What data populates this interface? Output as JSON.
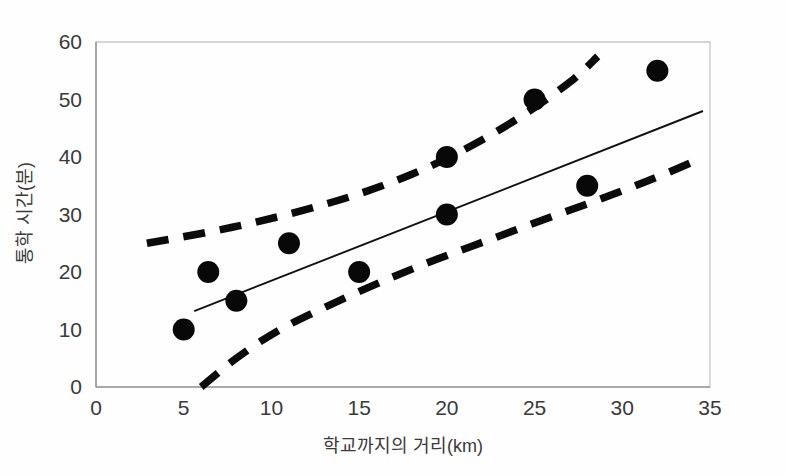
{
  "figure": {
    "background_color": "#ffffff",
    "point_color": "#080808",
    "line_color": "#111111",
    "band_color": "#0b0b0b",
    "axis_color": "#9a9a9a",
    "frame_color": "#c8c8c8",
    "text_color": "#3a3a3a"
  },
  "chart_data": {
    "type": "scatter",
    "title": "",
    "subtitle": "",
    "xlabel": "학교까지의 거리(km)",
    "ylabel": "통학 시간(분)",
    "xlim": [
      0,
      35
    ],
    "ylim": [
      0,
      60
    ],
    "xticks": [
      0,
      5,
      10,
      15,
      20,
      25,
      30,
      35
    ],
    "yticks": [
      0,
      10,
      20,
      30,
      40,
      50,
      60
    ],
    "xtick_labels": [
      "0",
      "5",
      "10",
      "15",
      "20",
      "25",
      "30",
      "35"
    ],
    "ytick_labels": [
      "0",
      "10",
      "20",
      "30",
      "40",
      "50",
      "60"
    ],
    "grid": false,
    "legend": null,
    "legend_position": "none",
    "series": [
      {
        "name": "observations",
        "type": "scatter",
        "marker": "filled-circle",
        "marker_size": 11,
        "color": "#080808",
        "points": [
          {
            "x": 5,
            "y": 10
          },
          {
            "x": 6.4,
            "y": 20
          },
          {
            "x": 8,
            "y": 15
          },
          {
            "x": 11,
            "y": 25
          },
          {
            "x": 15,
            "y": 20
          },
          {
            "x": 20,
            "y": 40
          },
          {
            "x": 20,
            "y": 30
          },
          {
            "x": 25,
            "y": 50
          },
          {
            "x": 28,
            "y": 35
          },
          {
            "x": 32,
            "y": 55
          }
        ]
      },
      {
        "name": "regression-line",
        "type": "line",
        "style": "solid",
        "color": "#111111",
        "points": [
          {
            "x": 5.6,
            "y": 13.2
          },
          {
            "x": 34.6,
            "y": 48.0
          }
        ]
      },
      {
        "name": "upper-confidence-band",
        "type": "line",
        "style": "dashed",
        "color": "#0b0b0b",
        "points": [
          {
            "x": 2.9,
            "y": 25.0
          },
          {
            "x": 6.0,
            "y": 26.7
          },
          {
            "x": 9.0,
            "y": 28.6
          },
          {
            "x": 12.0,
            "y": 30.9
          },
          {
            "x": 15.0,
            "y": 33.6
          },
          {
            "x": 18.0,
            "y": 37.0
          },
          {
            "x": 21.0,
            "y": 41.3
          },
          {
            "x": 24.0,
            "y": 46.6
          },
          {
            "x": 27.0,
            "y": 53.0
          },
          {
            "x": 28.6,
            "y": 57.5
          }
        ]
      },
      {
        "name": "lower-confidence-band",
        "type": "line",
        "style": "dashed",
        "color": "#0b0b0b",
        "points": [
          {
            "x": 6.0,
            "y": 0.0
          },
          {
            "x": 8.0,
            "y": 5.0
          },
          {
            "x": 10.5,
            "y": 10.0
          },
          {
            "x": 13.5,
            "y": 14.5
          },
          {
            "x": 16.5,
            "y": 18.6
          },
          {
            "x": 19.5,
            "y": 22.3
          },
          {
            "x": 22.5,
            "y": 25.7
          },
          {
            "x": 25.5,
            "y": 29.1
          },
          {
            "x": 28.5,
            "y": 32.4
          },
          {
            "x": 31.5,
            "y": 35.9
          },
          {
            "x": 34.3,
            "y": 39.5
          }
        ]
      }
    ]
  }
}
